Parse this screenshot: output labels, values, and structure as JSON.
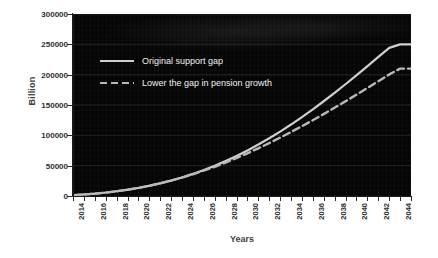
{
  "chart_data": {
    "type": "line",
    "title": "",
    "xlabel": "Years",
    "ylabel": "Billion",
    "xlim": [
      2014,
      2045
    ],
    "ylim": [
      0,
      300000
    ],
    "grid": true,
    "legend_position": "upper-left-inside",
    "background": "#050505",
    "y_ticks": [
      0,
      50000,
      100000,
      150000,
      200000,
      250000,
      300000
    ],
    "y_tick_labels": [
      "0",
      "50000",
      "100000",
      "150000",
      "200000",
      "250000",
      "300000"
    ],
    "x_ticks": [
      2014,
      2016,
      2018,
      2020,
      2022,
      2024,
      2026,
      2028,
      2030,
      2032,
      2034,
      2036,
      2038,
      2040,
      2042,
      2044
    ],
    "x_tick_labels": [
      "2014",
      "2016",
      "2018",
      "2020",
      "2022",
      "2024",
      "2026",
      "2028",
      "2030",
      "2032",
      "2034",
      "2036",
      "2038",
      "2040",
      "2042",
      "2044"
    ],
    "x_minor_ticks": [
      2014,
      2015,
      2016,
      2017,
      2018,
      2019,
      2020,
      2021,
      2022,
      2023,
      2024,
      2025,
      2026,
      2027,
      2028,
      2029,
      2030,
      2031,
      2032,
      2033,
      2034,
      2035,
      2036,
      2037,
      2038,
      2039,
      2040,
      2041,
      2042,
      2043,
      2044,
      2045
    ],
    "x": [
      2014,
      2015,
      2016,
      2017,
      2018,
      2019,
      2020,
      2021,
      2022,
      2023,
      2024,
      2025,
      2026,
      2027,
      2028,
      2029,
      2030,
      2031,
      2032,
      2033,
      2034,
      2035,
      2036,
      2037,
      2038,
      2039,
      2040,
      2041,
      2042,
      2043,
      2044,
      2045
    ],
    "series": [
      {
        "name": "Original support gap",
        "style": "solid",
        "color": "#cfcfcf",
        "values": [
          1500,
          2600,
          4000,
          5800,
          8000,
          10600,
          13600,
          17200,
          21200,
          25800,
          31000,
          36800,
          43200,
          50200,
          58000,
          66400,
          75400,
          85200,
          95600,
          106600,
          118200,
          130400,
          143200,
          156600,
          170400,
          184600,
          199200,
          214000,
          229200,
          244200,
          250000,
          250000
        ]
      },
      {
        "name": "Lower the gap in pension growth",
        "style": "dashed",
        "color": "#b8b8b8",
        "values": [
          1500,
          2600,
          4000,
          5800,
          8000,
          10600,
          13600,
          17200,
          21200,
          25800,
          30800,
          36200,
          42200,
          48600,
          55600,
          63000,
          70800,
          79000,
          87600,
          96600,
          105800,
          115400,
          125200,
          135400,
          145800,
          156400,
          167200,
          178200,
          189200,
          200400,
          210000,
          210000
        ]
      }
    ]
  },
  "legend": {
    "items": [
      {
        "label": "Original support gap",
        "style": "solid"
      },
      {
        "label": "Lower the gap in pension growth",
        "style": "dashed"
      }
    ]
  }
}
